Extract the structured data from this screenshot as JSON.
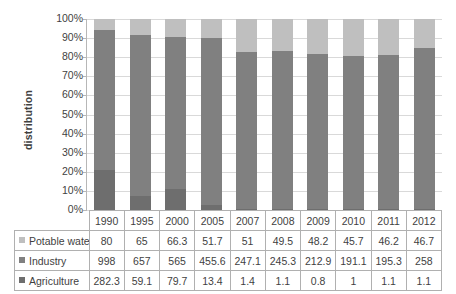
{
  "chart_data": {
    "type": "bar",
    "subtype": "stacked-100-percent",
    "title": "",
    "xlabel": "",
    "ylabel": "distribution",
    "ylim": [
      0,
      100
    ],
    "ytick_labels": [
      "0%",
      "10%",
      "20%",
      "30%",
      "40%",
      "50%",
      "60%",
      "70%",
      "80%",
      "90%",
      "100%"
    ],
    "ytick_values": [
      0,
      10,
      20,
      30,
      40,
      50,
      60,
      70,
      80,
      90,
      100
    ],
    "grid": true,
    "legend_position": "data-table-row-headers",
    "categories": [
      "1990",
      "1995",
      "2000",
      "2005",
      "2007",
      "2008",
      "2009",
      "2010",
      "2011",
      "2012"
    ],
    "stack_order_bottom_to_top": [
      "Agriculture",
      "Industry",
      "Potable water"
    ],
    "series": [
      {
        "name": "Potable water",
        "color": "#bfbfbf",
        "values": [
          80,
          65,
          66.3,
          51.7,
          51,
          49.5,
          48.2,
          45.7,
          46.2,
          46.7
        ],
        "percentages": [
          5.9,
          8.3,
          9.4,
          9.9,
          17.0,
          16.7,
          18.4,
          19.2,
          19.0,
          15.3
        ]
      },
      {
        "name": "Industry",
        "color": "#808080",
        "values": [
          998,
          657,
          565,
          455.6,
          247.1,
          245.3,
          212.9,
          191.1,
          195.3,
          258
        ],
        "percentages": [
          73.3,
          83.1,
          79.4,
          87.5,
          82.5,
          82.9,
          81.3,
          80.4,
          80.5,
          84.4
        ]
      },
      {
        "name": "Agriculture",
        "color": "#6e6e6e",
        "values": [
          282.3,
          59.1,
          79.7,
          13.4,
          1.4,
          1.1,
          0.8,
          1,
          1.1,
          1.1
        ],
        "percentages": [
          20.8,
          7.5,
          11.2,
          2.6,
          0.5,
          0.4,
          0.3,
          0.4,
          0.5,
          0.4
        ]
      }
    ]
  },
  "table": {
    "corner_label": "",
    "header_row": [
      "1990",
      "1995",
      "2000",
      "2005",
      "2007",
      "2008",
      "2009",
      "2010",
      "2011",
      "2012"
    ],
    "rows": [
      {
        "label": "Potable water",
        "swatch_class": "sw-pot",
        "cells": [
          "80",
          "65",
          "66.3",
          "51.7",
          "51",
          "49.5",
          "48.2",
          "45.7",
          "46.2",
          "46.7"
        ]
      },
      {
        "label": "Industry",
        "swatch_class": "sw-ind",
        "cells": [
          "998",
          "657",
          "565",
          "455.6",
          "247.1",
          "245.3",
          "212.9",
          "191.1",
          "195.3",
          "258"
        ]
      },
      {
        "label": "Agriculture",
        "swatch_class": "sw-agr",
        "cells": [
          "282.3",
          "59.1",
          "79.7",
          "13.4",
          "1.4",
          "1.1",
          "0.8",
          "1",
          "1.1",
          "1.1"
        ]
      }
    ]
  }
}
